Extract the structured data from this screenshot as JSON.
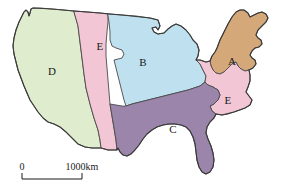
{
  "figure": {
    "type": "map",
    "background_color": "#ffffff",
    "border_color": "#4a4a4a"
  },
  "regions": [
    {
      "id": "A",
      "label": "A",
      "color": "#d4a878",
      "label_x": 232,
      "label_y": 62
    },
    {
      "id": "B",
      "label": "B",
      "color": "#bfe0ef",
      "label_x": 143,
      "label_y": 63
    },
    {
      "id": "C",
      "label": "C",
      "color": "#9b85ab",
      "label_x": 173,
      "label_y": 130
    },
    {
      "id": "D",
      "label": "D",
      "color": "#dfeccd",
      "label_x": 52,
      "label_y": 72
    },
    {
      "id": "E-plains",
      "label": "E",
      "color": "#f2c6d4",
      "label_x": 100,
      "label_y": 47
    },
    {
      "id": "E-midatlantic",
      "label": "E",
      "color": "#f2c6d4",
      "label_x": 228,
      "label_y": 101
    }
  ],
  "scale_bar": {
    "start_label": "0",
    "end_label": "1000km",
    "start_x": 22,
    "end_x": 82,
    "baseline_y": 178
  }
}
